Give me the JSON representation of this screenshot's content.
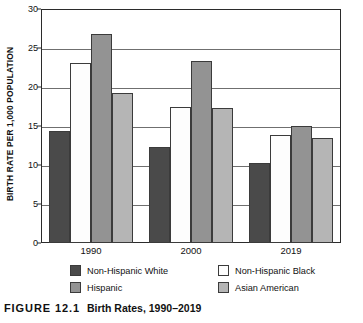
{
  "chart_data": {
    "type": "bar",
    "title": "Birth Rates, 1990–2019",
    "xlabel": "",
    "ylabel": "BIRTH RATE PER 1,000 POPULATION",
    "categories": [
      "1990",
      "2000",
      "2019"
    ],
    "ylim": [
      0,
      30
    ],
    "yticks": [
      0,
      5,
      10,
      15,
      20,
      25,
      30
    ],
    "ytick_labels": [
      "0",
      "5",
      "10",
      "15",
      "20",
      "25",
      "30"
    ],
    "grid": true,
    "legend_position": "bottom",
    "series": [
      {
        "name": "Non-Hispanic White",
        "color": "#4a4a4a",
        "values": [
          14.4,
          12.3,
          10.2
        ]
      },
      {
        "name": "Non-Hispanic Black",
        "color": "#fdfdfd",
        "values": [
          23.1,
          17.5,
          13.8
        ]
      },
      {
        "name": "Hispanic",
        "color": "#939393",
        "values": [
          26.8,
          23.3,
          15.0
        ]
      },
      {
        "name": "Asian American",
        "color": "#b5b5b5",
        "values": [
          19.2,
          17.3,
          13.4
        ]
      }
    ]
  },
  "figure": {
    "label": "FIGURE 12.1",
    "title": "Birth Rates, 1990–2019"
  }
}
